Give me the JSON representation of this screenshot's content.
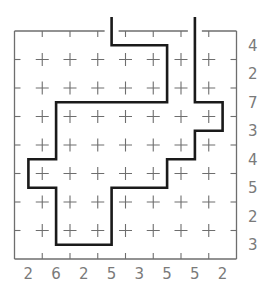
{
  "puzzle": {
    "type": "track-puzzle",
    "cols": 8,
    "rows": 8,
    "colors": {
      "background": "#ffffff",
      "grid": "#6e6e6e",
      "path": "#1a1a1a",
      "clue": "#7a7a7a"
    },
    "row_clues": [
      "4",
      "2",
      "7",
      "3",
      "4",
      "5",
      "2",
      "3"
    ],
    "col_clues": [
      "2",
      "6",
      "2",
      "5",
      "3",
      "5",
      "5",
      "2"
    ],
    "entry": {
      "col": 3,
      "side": "top"
    },
    "exit": {
      "col": 6,
      "side": "top"
    },
    "path_cells": [
      [
        3,
        -1
      ],
      [
        3,
        0
      ],
      [
        5,
        0
      ],
      [
        5,
        2
      ],
      [
        1,
        2
      ],
      [
        1,
        4
      ],
      [
        0,
        4
      ],
      [
        0,
        5
      ],
      [
        1,
        5
      ],
      [
        1,
        7
      ],
      [
        3,
        7
      ],
      [
        3,
        5
      ],
      [
        5,
        5
      ],
      [
        5,
        4
      ],
      [
        6,
        4
      ],
      [
        6,
        3
      ],
      [
        7,
        3
      ],
      [
        7,
        2
      ],
      [
        6,
        2
      ],
      [
        6,
        -1
      ]
    ]
  }
}
